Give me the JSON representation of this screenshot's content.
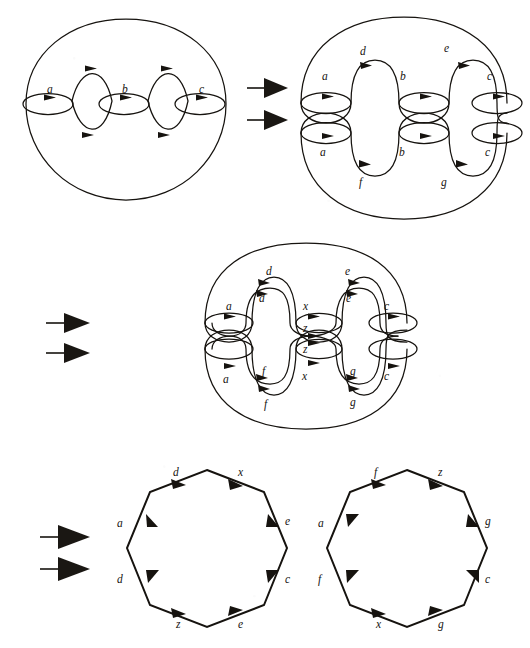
{
  "figure": {
    "background_color": "#ffffff",
    "ink_color": "#16130f",
    "panels": [
      {
        "id": "panel-top-left",
        "name": "genus-three-surface",
        "kind": "surface-with-curves",
        "curve_labels": [
          "a",
          "b",
          "c"
        ]
      },
      {
        "id": "panel-top-right",
        "name": "surface-cut-into-two-halves",
        "kind": "surface-split",
        "top_half_labels": [
          "a",
          "d",
          "b",
          "e",
          "c"
        ],
        "bottom_half_labels": [
          "a",
          "f",
          "b",
          "g",
          "c"
        ]
      },
      {
        "id": "panel-middle",
        "name": "surface-cut-further",
        "kind": "surface-split-doubled",
        "top_half_labels": [
          "a",
          "d",
          "d",
          "x",
          "e",
          "e",
          "c",
          "z"
        ],
        "bottom_half_labels": [
          "a",
          "f",
          "f",
          "x",
          "z",
          "g",
          "g",
          "c"
        ]
      },
      {
        "id": "panel-bottom-left",
        "name": "octagon-left",
        "kind": "octagon",
        "edge_labels": [
          "d",
          "x",
          "e",
          "c",
          "e",
          "z",
          "d",
          "a"
        ]
      },
      {
        "id": "panel-bottom-right",
        "name": "octagon-right",
        "kind": "octagon",
        "edge_labels": [
          "f",
          "z",
          "g",
          "c",
          "g",
          "x",
          "f",
          "a"
        ]
      }
    ],
    "implication_arrows": [
      {
        "id": "arrow-row-1",
        "name": "implication-arrow-top",
        "count": 2,
        "glyph": "double-right-arrow"
      },
      {
        "id": "arrow-row-2",
        "name": "implication-arrow-middle",
        "count": 2,
        "glyph": "double-right-arrow"
      },
      {
        "id": "arrow-row-3",
        "name": "implication-arrow-bottom",
        "count": 2,
        "glyph": "double-right-arrow"
      }
    ]
  },
  "panel_top_left": {
    "labels": [
      {
        "text": "a",
        "x": 47,
        "y": 93
      },
      {
        "text": "b",
        "x": 122,
        "y": 93
      },
      {
        "text": "c",
        "x": 199,
        "y": 93
      }
    ]
  },
  "panel_top_right": {
    "labels": [
      {
        "text": "a",
        "x": 322,
        "y": 80
      },
      {
        "text": "d",
        "x": 360,
        "y": 55
      },
      {
        "text": "b",
        "x": 400,
        "y": 80
      },
      {
        "text": "e",
        "x": 444,
        "y": 52
      },
      {
        "text": "c",
        "x": 487,
        "y": 80
      },
      {
        "text": "a",
        "x": 320,
        "y": 152
      },
      {
        "text": "f",
        "x": 359,
        "y": 176
      },
      {
        "text": "b",
        "x": 399,
        "y": 152
      },
      {
        "text": "g",
        "x": 441,
        "y": 177
      },
      {
        "text": "c",
        "x": 485,
        "y": 152
      }
    ]
  },
  "panel_middle": {
    "labels": [
      {
        "text": "a",
        "x": 226,
        "y": 303
      },
      {
        "text": "d",
        "x": 266,
        "y": 281
      },
      {
        "text": "d",
        "x": 266,
        "y": 305
      },
      {
        "text": "x",
        "x": 305,
        "y": 306
      },
      {
        "text": "z",
        "x": 305,
        "y": 330
      },
      {
        "text": "e",
        "x": 344,
        "y": 282
      },
      {
        "text": "e",
        "x": 344,
        "y": 307
      },
      {
        "text": "c",
        "x": 383,
        "y": 304
      },
      {
        "text": "a",
        "x": 223,
        "y": 378
      },
      {
        "text": "z",
        "x": 304,
        "y": 352
      },
      {
        "text": "f",
        "x": 264,
        "y": 371
      },
      {
        "text": "f",
        "x": 264,
        "y": 404
      },
      {
        "text": "x",
        "x": 303,
        "y": 376
      },
      {
        "text": "g",
        "x": 342,
        "y": 372
      },
      {
        "text": "g",
        "x": 342,
        "y": 402
      },
      {
        "text": "c",
        "x": 382,
        "y": 375
      }
    ]
  },
  "panel_bottom_left": {
    "labels": [
      {
        "text": "d",
        "x": 176,
        "y": 482
      },
      {
        "text": "x",
        "x": 237,
        "y": 481
      },
      {
        "text": "e",
        "x": 281,
        "y": 524
      },
      {
        "text": "c",
        "x": 281,
        "y": 582
      },
      {
        "text": "e",
        "x": 241,
        "y": 620
      },
      {
        "text": "z",
        "x": 179,
        "y": 621
      },
      {
        "text": "d",
        "x": 138,
        "y": 582
      },
      {
        "text": "a",
        "x": 138,
        "y": 525
      }
    ]
  },
  "panel_bottom_right": {
    "labels": [
      {
        "text": "f",
        "x": 376,
        "y": 482
      },
      {
        "text": "z",
        "x": 437,
        "y": 481
      },
      {
        "text": "g",
        "x": 481,
        "y": 524
      },
      {
        "text": "c",
        "x": 481,
        "y": 582
      },
      {
        "text": "g",
        "x": 441,
        "y": 620
      },
      {
        "text": "x",
        "x": 379,
        "y": 621
      },
      {
        "text": "f",
        "x": 338,
        "y": 582
      },
      {
        "text": "a",
        "x": 338,
        "y": 525
      }
    ]
  }
}
